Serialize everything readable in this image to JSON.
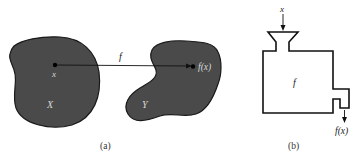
{
  "panel_a": {
    "caption": "(a)",
    "domain_set_label": "X",
    "codomain_set_label": "Y",
    "element_label": "x",
    "function_label": "f",
    "image_label": "f(x)",
    "blob_color": "#4a4a4a",
    "outline_color": "#1a1a1a",
    "label_color": "#d8d8d8"
  },
  "panel_b": {
    "caption": "(b)",
    "input_label": "x",
    "machine_label": "f",
    "output_label": "f(x)",
    "line_color": "#111111"
  }
}
